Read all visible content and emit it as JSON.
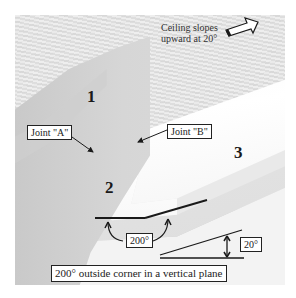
{
  "diagram": {
    "caption": "200° outside corner in a vertical plane",
    "ceiling_note_line1": "Ceiling slopes",
    "ceiling_note_line2": "upward at 20°",
    "ceiling_arrow_icon": "hollow-arrow-right-up",
    "labels": {
      "joint_a": "Joint \"A\"",
      "joint_b": "Joint \"B\""
    },
    "region_numbers": {
      "one": "1",
      "two": "2",
      "three": "3"
    },
    "angles": {
      "outside_corner": "200°",
      "slope": "20°"
    },
    "colors": {
      "annotation_line": "#1a1a1a",
      "label_background": "#ffffff"
    }
  }
}
